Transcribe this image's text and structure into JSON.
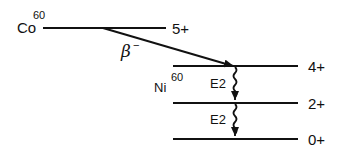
{
  "diagram": {
    "type": "nuclear-decay-scheme",
    "parent": {
      "symbol": "Co",
      "mass": "60",
      "level": "5+"
    },
    "decay": {
      "label": "β",
      "sup": "−"
    },
    "daughter": {
      "symbol": "Ni",
      "mass": "60"
    },
    "levels": [
      {
        "label": "4+"
      },
      {
        "label": "2+"
      },
      {
        "label": "0+"
      }
    ],
    "transitions": [
      {
        "label": "E2",
        "from": "4+",
        "to": "2+"
      },
      {
        "label": "E2",
        "from": "2+",
        "to": "0+"
      }
    ],
    "colors": {
      "ink": "#111111",
      "background": "#ffffff"
    }
  }
}
